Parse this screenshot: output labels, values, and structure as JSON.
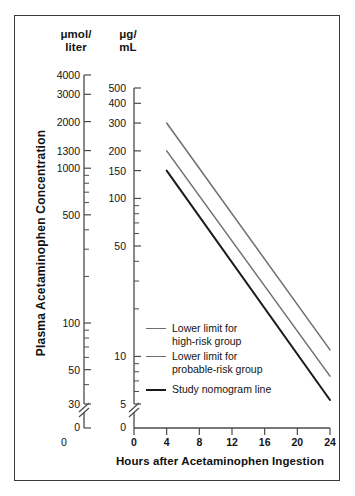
{
  "figure": {
    "y_axis_title": "Plasma Acetaminophen Concentration",
    "x_axis_title": "Hours after Acetaminophen Ingestion",
    "left_axis_header_line1": "μmol/",
    "left_axis_header_line2": "liter",
    "right_axis_header_line1": "μg/",
    "right_axis_header_line2": "mL"
  },
  "colors": {
    "frame": "#3c3c3c",
    "axis": "#4a4a4a",
    "text": "#141414",
    "line_gray": "#6e6e6e",
    "line_black": "#1a1a1a",
    "background": "#ffffff"
  },
  "legend": {
    "items": [
      {
        "label": "Lower limit for\nhigh-risk group",
        "color": "#6e6e6e",
        "series": "high-risk-lower-limit"
      },
      {
        "label": "Lower limit for\nprobable-risk group",
        "color": "#6e6e6e",
        "series": "probable-risk-lower-limit"
      },
      {
        "label": "Study nomogram line",
        "color": "#1a1a1a",
        "series": "study-nomogram-line"
      }
    ]
  },
  "chart_data": {
    "type": "line",
    "title": "",
    "subtitle": "",
    "xlabel": "Hours after Acetaminophen Ingestion",
    "ylabel": "Plasma Acetaminophen Concentration",
    "grid": false,
    "legend_position": "inside-lower-left",
    "x": [
      4,
      24
    ],
    "xlim": [
      0,
      24
    ],
    "xticks": [
      0,
      4,
      8,
      12,
      16,
      20,
      24
    ],
    "xtick_labels": [
      "0",
      "4",
      "8",
      "12",
      "16",
      "20",
      "24"
    ],
    "yscale": "log",
    "axis_break": true,
    "axis_break_symbol": "//",
    "y_axes": [
      {
        "name": "left",
        "unit": "μmol/liter",
        "ticks": [
          4000,
          3000,
          2000,
          1300,
          1000,
          500,
          100,
          50,
          30,
          0
        ],
        "tick_labels": [
          "4000",
          "3000",
          "2000",
          "1300",
          "1000",
          "500",
          "100",
          "50",
          "30",
          "0"
        ],
        "minor_ticks": [
          900,
          800,
          700,
          600,
          400,
          300,
          200,
          90,
          80,
          70,
          60,
          40
        ],
        "ylim": [
          30,
          4000
        ]
      },
      {
        "name": "right",
        "unit": "μg/mL",
        "ticks": [
          500,
          400,
          300,
          200,
          150,
          100,
          50,
          10,
          5,
          0
        ],
        "tick_labels": [
          "500",
          "400",
          "300",
          "200",
          "150",
          "100",
          "50",
          "10",
          "5",
          "0"
        ],
        "minor_ticks": [
          90,
          80,
          70,
          60,
          40,
          30,
          20,
          9,
          8,
          7,
          6
        ],
        "ylim": [
          5,
          500
        ]
      }
    ],
    "series": [
      {
        "name": "Lower limit for high-risk group",
        "color": "#6e6e6e",
        "unit": "μg/mL",
        "points": [
          {
            "x": 4,
            "y": 300
          },
          {
            "x": 24,
            "y": 11
          }
        ]
      },
      {
        "name": "Lower limit for probable-risk group",
        "color": "#6e6e6e",
        "unit": "μg/mL",
        "points": [
          {
            "x": 4,
            "y": 200
          },
          {
            "x": 24,
            "y": 7.5
          }
        ]
      },
      {
        "name": "Study nomogram line",
        "color": "#1a1a1a",
        "unit": "μg/mL",
        "points": [
          {
            "x": 4,
            "y": 150
          },
          {
            "x": 24,
            "y": 5.3
          }
        ]
      }
    ]
  },
  "ticks": {
    "left_labels": [
      "4000",
      "3000",
      "2000",
      "1300",
      "1000",
      "500",
      "100",
      "50",
      "30",
      "0"
    ],
    "right_labels": [
      "500",
      "400",
      "300",
      "200",
      "150",
      "100",
      "50",
      "10",
      "5",
      "0"
    ],
    "x_labels": [
      "0",
      "4",
      "8",
      "12",
      "16",
      "20",
      "24"
    ],
    "x_origin_left_axis": "0"
  }
}
